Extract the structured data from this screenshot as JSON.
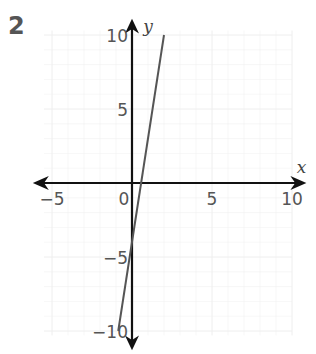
{
  "question_number": "2",
  "chart_data": {
    "type": "line",
    "title": "",
    "xlabel": "x",
    "ylabel": "y",
    "xlim": [
      -6,
      11
    ],
    "ylim": [
      -11,
      11
    ],
    "x_ticks": [
      -5,
      0,
      5,
      10
    ],
    "y_ticks": [
      -10,
      -5,
      5,
      10
    ],
    "x_tick_labels": [
      "−5",
      "0",
      "5",
      "10"
    ],
    "y_tick_labels": [
      "−10",
      "−5",
      "5",
      "10"
    ],
    "grid": true,
    "series": [
      {
        "name": "y = 7x − 4",
        "x": [
          -0.86,
          2
        ],
        "y": [
          -10,
          10
        ],
        "color": "#555555"
      }
    ],
    "colors": {
      "axis": "#111111",
      "line": "#555555",
      "grid": "#eeeeee"
    }
  }
}
